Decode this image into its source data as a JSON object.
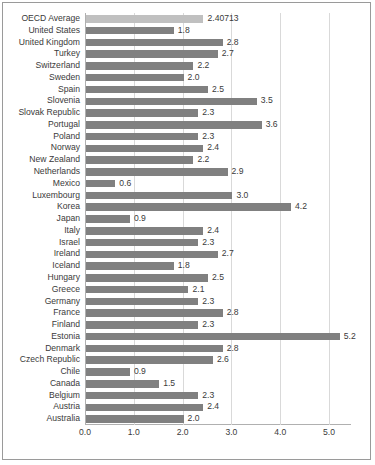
{
  "chart_data": {
    "type": "bar",
    "orientation": "horizontal",
    "title": "",
    "xlabel": "",
    "ylabel": "",
    "xlim": [
      0.0,
      5.45
    ],
    "grid": true,
    "legend": null,
    "xticks": [
      "0.0",
      "1.0",
      "2.0",
      "3.0",
      "4.0",
      "5.0"
    ],
    "xtick_values": [
      0.0,
      1.0,
      2.0,
      3.0,
      4.0,
      5.0
    ],
    "categories": [
      "OECD Average",
      "United States",
      "United Kingdom",
      "Turkey",
      "Switzerland",
      "Sweden",
      "Spain",
      "Slovenia",
      "Slovak Republic",
      "Portugal",
      "Poland",
      "Norway",
      "New Zealand",
      "Netherlands",
      "Mexico",
      "Luxembourg",
      "Korea",
      "Japan",
      "Italy",
      "Israel",
      "Ireland",
      "Iceland",
      "Hungary",
      "Greece",
      "Germany",
      "France",
      "Finland",
      "Estonia",
      "Denmark",
      "Czech Republic",
      "Chile",
      "Canada",
      "Belgium",
      "Austria",
      "Australia"
    ],
    "values": [
      2.40713,
      1.8,
      2.8,
      2.7,
      2.2,
      2.0,
      2.5,
      3.5,
      2.3,
      3.6,
      2.3,
      2.4,
      2.2,
      2.9,
      0.6,
      3.0,
      4.2,
      0.9,
      2.4,
      2.3,
      2.7,
      1.8,
      2.5,
      2.1,
      2.3,
      2.8,
      2.3,
      5.2,
      2.8,
      2.6,
      0.9,
      1.5,
      2.3,
      2.4,
      2.0
    ],
    "data_labels": [
      "2.40713",
      "1.8",
      "2.8",
      "2.7",
      "2.2",
      "2.0",
      "2.5",
      "3.5",
      "2.3",
      "3.6",
      "2.3",
      "2.4",
      "2.2",
      "2.9",
      "0.6",
      "3.0",
      "4.2",
      "0.9",
      "2.4",
      "2.3",
      "2.7",
      "1.8",
      "2.5",
      "2.1",
      "2.3",
      "2.8",
      "2.3",
      "5.2",
      "2.8",
      "2.6",
      "0.9",
      "1.5",
      "2.3",
      "2.4",
      "2.0"
    ],
    "colors": {
      "bar": "#808080",
      "highlight_bar": "#c0c0c0",
      "gridline": "#d9d9d9",
      "axis": "#b0b0b0",
      "text": "#3a3a3a",
      "background": "#ffffff",
      "border": "#9a9a9a"
    },
    "highlight_category": "OECD Average"
  }
}
